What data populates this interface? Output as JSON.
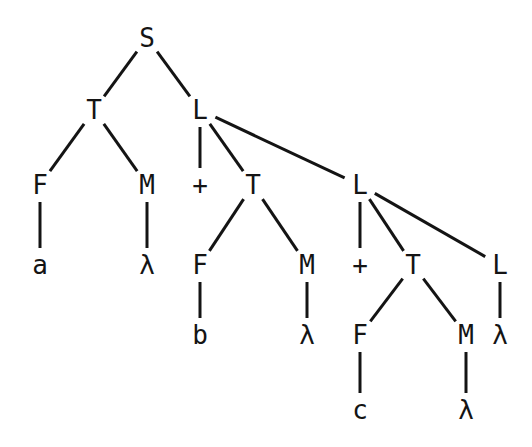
{
  "diagram": {
    "type": "parse-tree",
    "background": "#ffffff",
    "ink": "#141414",
    "nodes": [
      {
        "id": "S",
        "label": "S",
        "x": 147,
        "y": 38
      },
      {
        "id": "T1",
        "label": "T",
        "x": 94,
        "y": 110
      },
      {
        "id": "L1",
        "label": "L",
        "x": 200,
        "y": 110
      },
      {
        "id": "F1",
        "label": "F",
        "x": 40,
        "y": 185
      },
      {
        "id": "M1",
        "label": "M",
        "x": 147,
        "y": 185
      },
      {
        "id": "P1",
        "label": "+",
        "x": 200,
        "y": 185
      },
      {
        "id": "T2",
        "label": "T",
        "x": 253,
        "y": 185
      },
      {
        "id": "L2",
        "label": "L",
        "x": 360,
        "y": 185
      },
      {
        "id": "a",
        "label": "a",
        "x": 40,
        "y": 265
      },
      {
        "id": "lam1",
        "label": "λ",
        "x": 147,
        "y": 265
      },
      {
        "id": "F2",
        "label": "F",
        "x": 200,
        "y": 265
      },
      {
        "id": "M2",
        "label": "M",
        "x": 307,
        "y": 265
      },
      {
        "id": "P2",
        "label": "+",
        "x": 360,
        "y": 265
      },
      {
        "id": "T3",
        "label": "T",
        "x": 413,
        "y": 265
      },
      {
        "id": "L3",
        "label": "L",
        "x": 500,
        "y": 265
      },
      {
        "id": "b",
        "label": "b",
        "x": 200,
        "y": 335
      },
      {
        "id": "lam2",
        "label": "λ",
        "x": 307,
        "y": 335
      },
      {
        "id": "F3",
        "label": "F",
        "x": 360,
        "y": 335
      },
      {
        "id": "M3",
        "label": "M",
        "x": 466,
        "y": 335
      },
      {
        "id": "lam3",
        "label": "λ",
        "x": 500,
        "y": 335
      },
      {
        "id": "c",
        "label": "c",
        "x": 360,
        "y": 410
      },
      {
        "id": "lam4",
        "label": "λ",
        "x": 466,
        "y": 410
      }
    ],
    "edges": [
      [
        "S",
        "T1"
      ],
      [
        "S",
        "L1"
      ],
      [
        "T1",
        "F1"
      ],
      [
        "T1",
        "M1"
      ],
      [
        "L1",
        "P1"
      ],
      [
        "L1",
        "T2"
      ],
      [
        "L1",
        "L2"
      ],
      [
        "F1",
        "a"
      ],
      [
        "M1",
        "lam1"
      ],
      [
        "T2",
        "F2"
      ],
      [
        "T2",
        "M2"
      ],
      [
        "L2",
        "P2"
      ],
      [
        "L2",
        "T3"
      ],
      [
        "L2",
        "L3"
      ],
      [
        "F2",
        "b"
      ],
      [
        "M2",
        "lam2"
      ],
      [
        "T3",
        "F3"
      ],
      [
        "T3",
        "M3"
      ],
      [
        "L3",
        "lam3"
      ],
      [
        "F3",
        "c"
      ],
      [
        "M3",
        "lam4"
      ]
    ]
  }
}
